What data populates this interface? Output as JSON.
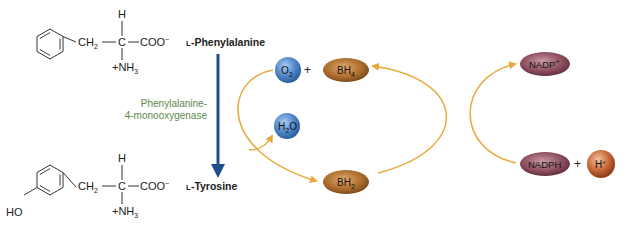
{
  "colors": {
    "main_arrow": "#1f4e8c",
    "cycle_arrow": "#e8a93a",
    "enzyme_text": "#5a8a4a",
    "oxygen_fill": "#4f86c9",
    "biopterin_fill": "#a8692a",
    "nadp_fill": "#8a4a5a",
    "proton_fill": "#c8673a",
    "structure": "#333333"
  },
  "substrate": {
    "name": "L-Phenylalanine",
    "prefix": "L",
    "label": "-Phenylalanine",
    "structure": {
      "h": "H",
      "ch2": "CH",
      "ch2_sub": "2",
      "c": "C",
      "coo": "COO",
      "coo_sup": "−",
      "nh3": "+NH",
      "nh3_sub": "3"
    }
  },
  "product": {
    "name": "L-Tyrosine",
    "prefix": "L",
    "label": "-Tyrosine",
    "structure": {
      "ho": "HO",
      "h": "H",
      "ch2": "CH",
      "ch2_sub": "2",
      "c": "C",
      "coo": "COO",
      "coo_sup": "−",
      "nh3": "+NH",
      "nh3_sub": "3"
    }
  },
  "enzyme": {
    "line1": "Phenylalanine-",
    "line2": "4-monooxygenase"
  },
  "cofactors": {
    "o2": {
      "base": "O",
      "sub": "2"
    },
    "plus1": "+",
    "bh4": {
      "base": "BH",
      "sub": "4"
    },
    "h2o": {
      "base": "H",
      "sub": "2",
      "tail": "O"
    },
    "bh2": {
      "base": "BH",
      "sub": "2"
    },
    "nadp": {
      "base": "NADP",
      "sup": "+"
    },
    "nadph": "NADPH",
    "plus2": "+",
    "h": {
      "base": "H",
      "sup": "+"
    }
  }
}
